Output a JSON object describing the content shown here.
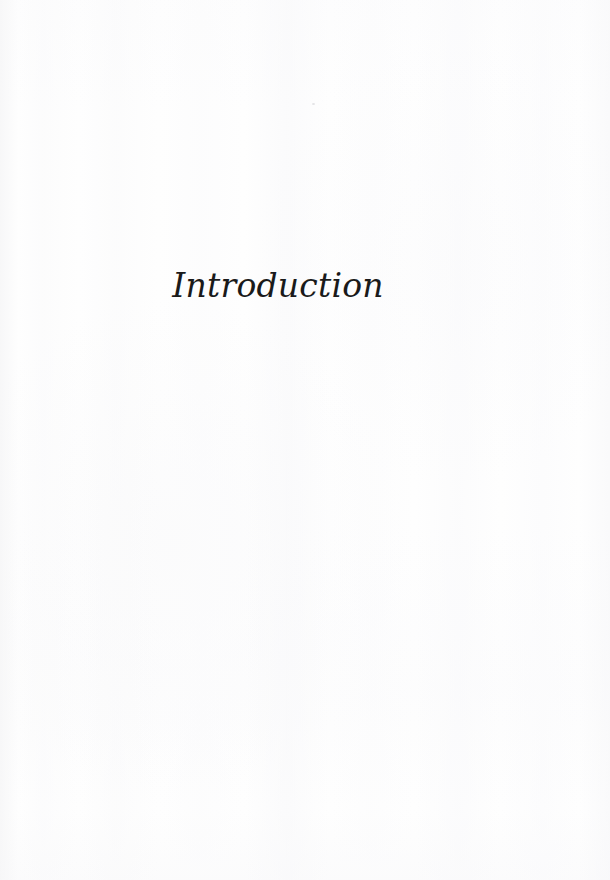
{
  "document": {
    "page_background_color": "#fefefe",
    "text_color": "#1a1a1a",
    "page_width": 610,
    "page_height": 880
  },
  "page": {
    "chapter_title": "Introduction",
    "header": "",
    "footer": "",
    "page_number": "",
    "body_text": ""
  },
  "artifacts": {
    "speck_label": ""
  }
}
